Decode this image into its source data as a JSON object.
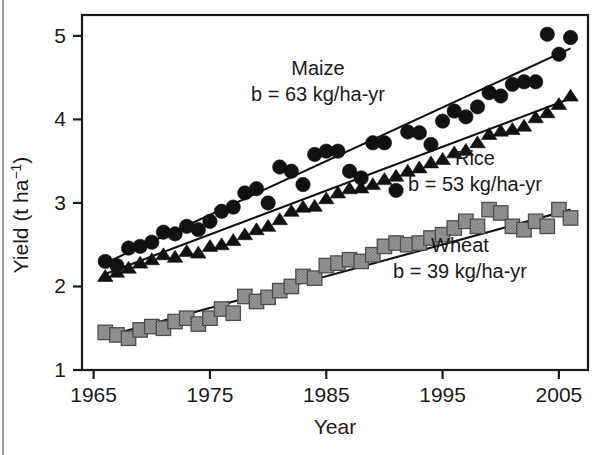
{
  "figure": {
    "background": "#ffffff",
    "frame_color": "#1a1a1a"
  },
  "axes": {
    "y_title": "Yield (t ha",
    "y_title_sup": "−1",
    "y_title_close": ")",
    "x_title": "Year",
    "x_ticks": [
      "1965",
      "1975",
      "1985",
      "1995",
      "2005"
    ],
    "y_ticks": [
      "1",
      "2",
      "3",
      "4",
      "5"
    ]
  },
  "annotations": {
    "maize_name": "Maize",
    "maize_slope": "b = 63 kg/ha-yr",
    "rice_name": "Rice",
    "rice_slope": "b = 53 kg/ha-yr",
    "wheat_name": "Wheat",
    "wheat_slope": "b = 39 kg/ha-yr"
  },
  "colors": {
    "maize_marker": "#111111",
    "rice_marker": "#111111",
    "wheat_marker": "#9a9a9a",
    "wheat_marker_edge": "#4d4d4d",
    "trend_line": "#111111",
    "axis": "#1a1a1a"
  },
  "chart_data": {
    "type": "scatter",
    "title": "",
    "xlabel": "Year",
    "ylabel": "Yield (t ha−1)",
    "xlim": [
      1964,
      2007.5
    ],
    "ylim": [
      1,
      5.25
    ],
    "grid": false,
    "legend": "in-plot annotations",
    "x": [
      1966,
      1967,
      1968,
      1969,
      1970,
      1971,
      1972,
      1973,
      1974,
      1975,
      1976,
      1977,
      1978,
      1979,
      1980,
      1981,
      1982,
      1983,
      1984,
      1985,
      1986,
      1987,
      1988,
      1989,
      1990,
      1991,
      1992,
      1993,
      1994,
      1995,
      1996,
      1997,
      1998,
      1999,
      2000,
      2001,
      2002,
      2003,
      2004,
      2005,
      2006
    ],
    "series": [
      {
        "name": "Maize",
        "marker": "circle",
        "slope_label": "b = 63 kg/ha-yr",
        "slope_kg_ha_yr": 63,
        "values": [
          2.3,
          2.25,
          2.46,
          2.48,
          2.53,
          2.65,
          2.63,
          2.72,
          2.68,
          2.78,
          2.9,
          2.95,
          3.12,
          3.17,
          3.0,
          3.43,
          3.38,
          3.22,
          3.58,
          3.62,
          3.62,
          3.38,
          3.3,
          3.72,
          3.72,
          3.15,
          3.85,
          3.84,
          3.7,
          3.98,
          4.1,
          4.03,
          4.15,
          4.32,
          4.28,
          4.42,
          4.45,
          4.45,
          5.02,
          4.78,
          4.98
        ],
        "trend": {
          "x": [
            1966,
            2006
          ],
          "y": [
            2.28,
            4.85
          ]
        }
      },
      {
        "name": "Rice",
        "marker": "triangle",
        "slope_label": "b = 53 kg/ha-yr",
        "slope_kg_ha_yr": 53,
        "values": [
          2.12,
          2.17,
          2.22,
          2.28,
          2.32,
          2.38,
          2.35,
          2.42,
          2.4,
          2.48,
          2.5,
          2.55,
          2.62,
          2.68,
          2.72,
          2.8,
          2.9,
          2.95,
          2.96,
          3.05,
          3.12,
          3.17,
          3.18,
          3.22,
          3.28,
          3.32,
          3.38,
          3.42,
          3.48,
          3.52,
          3.6,
          3.63,
          3.72,
          3.82,
          3.86,
          3.88,
          3.92,
          4.02,
          4.08,
          4.18,
          4.28
        ],
        "trend": {
          "x": [
            1966,
            2006
          ],
          "y": [
            2.15,
            4.25
          ]
        }
      },
      {
        "name": "Wheat",
        "marker": "square",
        "slope_label": "b = 39 kg/ha-yr",
        "slope_kg_ha_yr": 39,
        "values": [
          1.45,
          1.42,
          1.38,
          1.48,
          1.52,
          1.5,
          1.58,
          1.62,
          1.55,
          1.62,
          1.73,
          1.68,
          1.88,
          1.82,
          1.87,
          1.95,
          2.0,
          2.12,
          2.1,
          2.25,
          2.28,
          2.32,
          2.3,
          2.38,
          2.48,
          2.52,
          2.5,
          2.52,
          2.58,
          2.62,
          2.7,
          2.78,
          2.72,
          2.92,
          2.88,
          2.72,
          2.68,
          2.78,
          2.72,
          2.92,
          2.82
        ],
        "trend": {
          "x": [
            1966,
            2006
          ],
          "y": [
            1.4,
            2.92
          ]
        }
      }
    ]
  }
}
